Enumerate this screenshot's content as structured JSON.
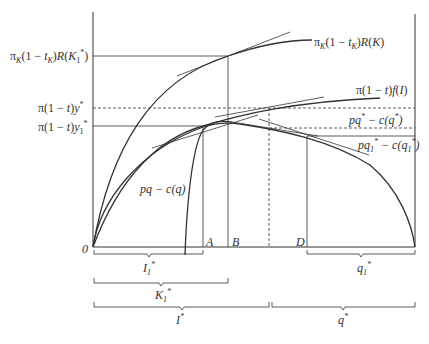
{
  "diagram": {
    "axes": {
      "origin_label": "0"
    },
    "y_axis_labels": {
      "top": "πK(1 − tK)R(K1*)",
      "dashed": "π(1 − t)y*",
      "solid": "π(1 − t)y1*"
    },
    "curve_labels": {
      "capital_return": "πK(1 − tK)R(K)",
      "income": "π(1 − t)f(I)",
      "profit_rising": "pq − c(q)",
      "profit_star": "pq* − c(q*)",
      "profit_star1": "pq1* − c(q1*)"
    },
    "x_axis_points": {
      "A": "A",
      "B": "B",
      "D": "D"
    },
    "braces": {
      "I1": "I1*",
      "K1": "K1*",
      "Istar": "I*",
      "q1": "q1*",
      "qstar": "q*"
    }
  },
  "colors": {
    "line": "#2a2a2a",
    "thin": "#555555",
    "background": "#ffffff"
  }
}
